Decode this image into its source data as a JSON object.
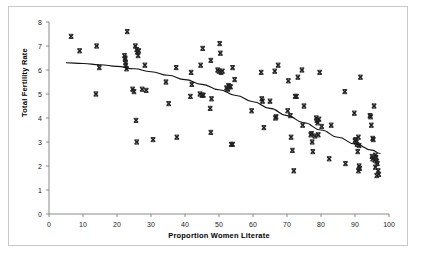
{
  "chart_data": {
    "type": "scatter",
    "title": "",
    "xlabel": "Proportion Women Literate",
    "ylabel": "Total Fertility Rate",
    "xlim": [
      0,
      100
    ],
    "ylim": [
      0,
      8
    ],
    "xticks": [
      0,
      10,
      20,
      30,
      40,
      50,
      60,
      70,
      80,
      90,
      100
    ],
    "yticks": [
      0,
      1,
      2,
      3,
      4,
      5,
      6,
      7,
      8
    ],
    "grid": false,
    "legend": null,
    "marker": "x-cross",
    "marker_color": "#222222",
    "trend_color": "#111111",
    "series": [
      {
        "name": "Countries",
        "points": [
          [
            6.5,
            7.4
          ],
          [
            9.0,
            6.8
          ],
          [
            14.0,
            7.0
          ],
          [
            13.8,
            5.0
          ],
          [
            14.8,
            6.1
          ],
          [
            22.2,
            6.6
          ],
          [
            22.4,
            6.5
          ],
          [
            22.5,
            6.3
          ],
          [
            22.6,
            6.2
          ],
          [
            22.8,
            6.05
          ],
          [
            23.0,
            7.6
          ],
          [
            25.4,
            7.0
          ],
          [
            25.8,
            6.85
          ],
          [
            26.2,
            6.6
          ],
          [
            26.0,
            6.75
          ],
          [
            28.2,
            6.2
          ],
          [
            24.6,
            5.2
          ],
          [
            25.0,
            5.1
          ],
          [
            27.4,
            5.2
          ],
          [
            28.6,
            5.15
          ],
          [
            25.6,
            3.9
          ],
          [
            25.8,
            3.0
          ],
          [
            30.6,
            3.1
          ],
          [
            34.4,
            5.5
          ],
          [
            35.2,
            4.6
          ],
          [
            37.4,
            6.1
          ],
          [
            37.6,
            3.2
          ],
          [
            41.8,
            5.9
          ],
          [
            42.0,
            5.4
          ],
          [
            41.6,
            4.9
          ],
          [
            44.6,
            6.2
          ],
          [
            44.4,
            5.0
          ],
          [
            45.0,
            4.95
          ],
          [
            45.2,
            6.9
          ],
          [
            47.6,
            6.4
          ],
          [
            47.8,
            4.8
          ],
          [
            47.4,
            4.4
          ],
          [
            47.6,
            3.4
          ],
          [
            49.6,
            6.0
          ],
          [
            50.0,
            5.95
          ],
          [
            50.2,
            7.1
          ],
          [
            50.4,
            6.7
          ],
          [
            51.0,
            5.95
          ],
          [
            52.2,
            5.25
          ],
          [
            52.6,
            5.2
          ],
          [
            53.0,
            5.3
          ],
          [
            53.4,
            5.3
          ],
          [
            54.0,
            6.1
          ],
          [
            54.6,
            5.6
          ],
          [
            53.6,
            2.9
          ],
          [
            54.0,
            2.9
          ],
          [
            59.6,
            4.3
          ],
          [
            62.4,
            5.9
          ],
          [
            62.6,
            4.8
          ],
          [
            62.8,
            4.7
          ],
          [
            63.2,
            3.6
          ],
          [
            65.0,
            4.7
          ],
          [
            66.4,
            5.95
          ],
          [
            66.6,
            4.0
          ],
          [
            67.4,
            6.2
          ],
          [
            70.2,
            4.3
          ],
          [
            70.4,
            5.55
          ],
          [
            71.0,
            4.1
          ],
          [
            71.2,
            3.2
          ],
          [
            71.6,
            2.65
          ],
          [
            72.0,
            1.8
          ],
          [
            72.4,
            4.9
          ],
          [
            72.8,
            4.9
          ],
          [
            73.2,
            5.7
          ],
          [
            74.4,
            6.0
          ],
          [
            75.0,
            4.5
          ],
          [
            74.6,
            3.7
          ],
          [
            77.0,
            3.3
          ],
          [
            77.2,
            3.35
          ],
          [
            77.4,
            3.0
          ],
          [
            77.6,
            2.6
          ],
          [
            78.6,
            4.0
          ],
          [
            78.8,
            3.9
          ],
          [
            79.0,
            3.8
          ],
          [
            79.2,
            3.3
          ],
          [
            79.6,
            5.9
          ],
          [
            80.2,
            3.65
          ],
          [
            82.4,
            2.3
          ],
          [
            83.0,
            3.7
          ],
          [
            87.0,
            5.1
          ],
          [
            87.2,
            2.1
          ],
          [
            89.8,
            4.2
          ],
          [
            90.2,
            3.1
          ],
          [
            90.4,
            3.0
          ],
          [
            90.6,
            2.9
          ],
          [
            90.8,
            2.6
          ],
          [
            91.0,
            3.2
          ],
          [
            91.2,
            2.0
          ],
          [
            91.4,
            1.9
          ],
          [
            91.0,
            1.8
          ],
          [
            91.6,
            5.7
          ],
          [
            94.4,
            4.1
          ],
          [
            94.6,
            4.05
          ],
          [
            94.8,
            3.7
          ],
          [
            95.6,
            4.5
          ],
          [
            95.2,
            3.15
          ],
          [
            95.4,
            3.1
          ],
          [
            95.0,
            2.4
          ],
          [
            95.2,
            2.3
          ],
          [
            96.0,
            2.45
          ],
          [
            96.2,
            2.35
          ],
          [
            96.4,
            2.2
          ],
          [
            96.6,
            2.1
          ],
          [
            96.8,
            1.8
          ],
          [
            97.0,
            1.65
          ],
          [
            96.4,
            1.6
          ],
          [
            22.4,
            6.45
          ],
          [
            45.4,
            4.95
          ],
          [
            52.8,
            5.35
          ],
          [
            79.4,
            3.95
          ],
          [
            91.2,
            2.85
          ],
          [
            95.8,
            2.25
          ],
          [
            26.4,
            6.8
          ],
          [
            50.6,
            5.9
          ],
          [
            66.8,
            4.05
          ],
          [
            78.2,
            3.25
          ],
          [
            90.0,
            3.05
          ],
          [
            96.0,
            1.95
          ]
        ]
      }
    ],
    "trend_curve": {
      "name": "fitted curve",
      "points": [
        [
          5.0,
          6.3
        ],
        [
          10.0,
          6.27
        ],
        [
          15.0,
          6.22
        ],
        [
          20.0,
          6.15
        ],
        [
          25.0,
          6.05
        ],
        [
          30.0,
          5.93
        ],
        [
          35.0,
          5.78
        ],
        [
          40.0,
          5.6
        ],
        [
          45.0,
          5.4
        ],
        [
          50.0,
          5.18
        ],
        [
          55.0,
          4.94
        ],
        [
          60.0,
          4.68
        ],
        [
          65.0,
          4.4
        ],
        [
          70.0,
          4.1
        ],
        [
          75.0,
          3.8
        ],
        [
          80.0,
          3.5
        ],
        [
          85.0,
          3.2
        ],
        [
          90.0,
          2.92
        ],
        [
          95.0,
          2.66
        ],
        [
          97.5,
          2.52
        ]
      ]
    }
  }
}
